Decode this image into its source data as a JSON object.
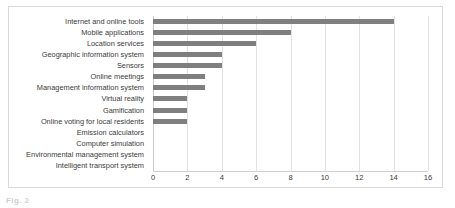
{
  "chart_data": {
    "type": "bar",
    "orientation": "horizontal",
    "title": "",
    "subtitle": "",
    "xlabel": "",
    "ylabel": "",
    "grid": true,
    "legend": false,
    "legend_position": "none",
    "xlim": [
      0,
      16
    ],
    "xticks": [
      0,
      2,
      4,
      6,
      8,
      10,
      12,
      14,
      16
    ],
    "xtick_labels": [
      "0",
      "2",
      "4",
      "6",
      "8",
      "10",
      "12",
      "14",
      "16"
    ],
    "bar_color": "#7f7f7f",
    "categories": [
      "Internet and online tools",
      "Mobile applications",
      "Location services",
      "Geographic information system",
      "Sensors",
      "Online meetings",
      "Management information system",
      "Virtual reality",
      "Gamification",
      "Online voting for local residents",
      "Emission calculators",
      "Computer simulation",
      "Environmental management system",
      "Intelligent transport system"
    ],
    "values": [
      14,
      8,
      6,
      4,
      4,
      3,
      3,
      2,
      2,
      2,
      0,
      0,
      0,
      0
    ]
  },
  "caption": {
    "text": "Fig. 2"
  }
}
